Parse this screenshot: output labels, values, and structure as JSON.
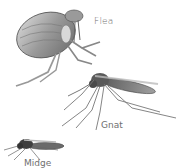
{
  "illustration": {
    "subjects": [
      {
        "id": "flea",
        "label": "Flea"
      },
      {
        "id": "gnat",
        "label": "Gnat"
      },
      {
        "id": "midge",
        "label": "Midge"
      }
    ],
    "colors": {
      "background": "#ffffff",
      "insect_dark": "#4a4a4a",
      "insect_mid": "#8a8a8a",
      "insect_light": "#c8c8c8",
      "label": "#6f6f6f"
    }
  }
}
